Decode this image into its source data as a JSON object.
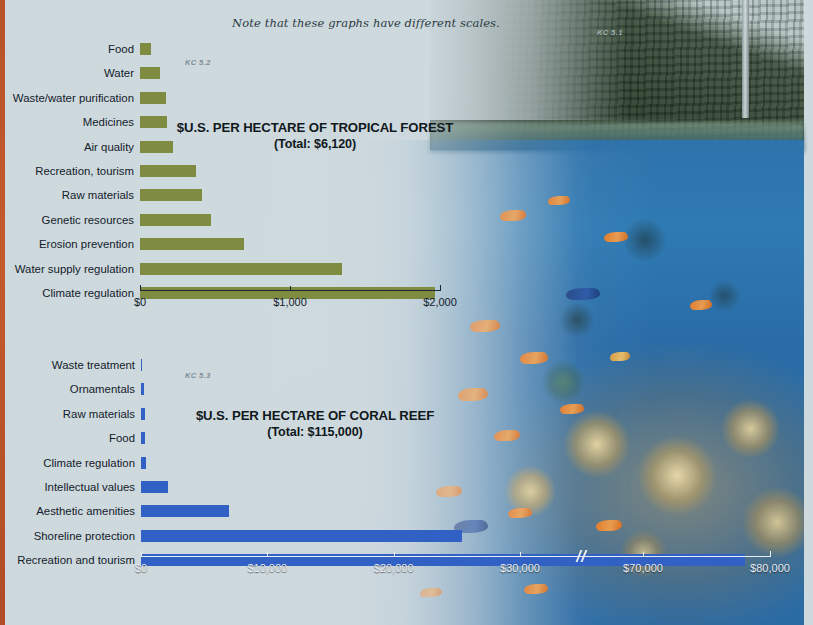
{
  "page": {
    "note": "Note that these graphs have different scales.",
    "figure_tags": [
      "KC 5.1",
      "KC 5.2",
      "KC 5.3"
    ]
  },
  "chart_data": [
    {
      "id": "tropical-forest",
      "type": "bar",
      "orientation": "horizontal",
      "tag": "KC 5.2",
      "title": "$U.S. PER HECTARE OF TROPICAL FOREST",
      "subtitle": "(Total: $6,120)",
      "total": "$6,120",
      "xlabel": "",
      "ylabel": "",
      "bar_color": "#7e8b40",
      "grid": false,
      "legend": false,
      "xlim": [
        0,
        2000
      ],
      "ticks": [
        0,
        1000,
        2000
      ],
      "tick_labels": [
        "$0",
        "$1,000",
        "$2,000"
      ],
      "categories": [
        "Food",
        "Water",
        "Waste/water purification",
        "Medicines",
        "Air quality",
        "Recreation, tourism",
        "Raw materials",
        "Genetic resources",
        "Erosion prevention",
        "Water supply regulation",
        "Climate regulation"
      ],
      "values": [
        75,
        135,
        170,
        180,
        220,
        375,
        415,
        470,
        690,
        1345,
        1965
      ]
    },
    {
      "id": "coral-reef",
      "type": "bar",
      "orientation": "horizontal",
      "tag": "KC 5.3",
      "title": "$U.S. PER HECTARE OF CORAL REEF",
      "subtitle": "(Total: $115,000)",
      "total": "$115,000",
      "xlabel": "",
      "ylabel": "",
      "bar_color": "#3161c4",
      "grid": false,
      "legend": false,
      "xlim": [
        0,
        80000
      ],
      "axis_break_after": 30000,
      "ticks": [
        0,
        10000,
        20000,
        30000,
        70000,
        80000
      ],
      "tick_labels": [
        "$0",
        "$10,000",
        "$20,000",
        "$30,000",
        "$70,000",
        "$80,000"
      ],
      "categories": [
        "Waste treatment",
        "Ornamentals",
        "Raw materials",
        "Food",
        "Climate regulation",
        "Intellectual values",
        "Aesthetic amenities",
        "Shoreline protection",
        "Recreation and tourism"
      ],
      "values": [
        60,
        240,
        280,
        320,
        420,
        2100,
        7000,
        25400,
        78000
      ]
    }
  ]
}
